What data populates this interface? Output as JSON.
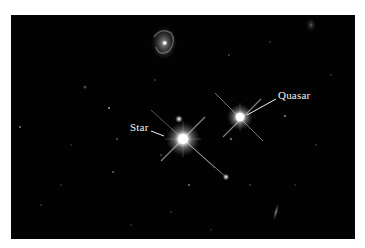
{
  "figure": {
    "labels": {
      "star": "Star",
      "quasar": "Quasar"
    },
    "colors": {
      "background": "#020202",
      "frame": "#ffffff",
      "label_text": "#f2f2f2"
    }
  }
}
